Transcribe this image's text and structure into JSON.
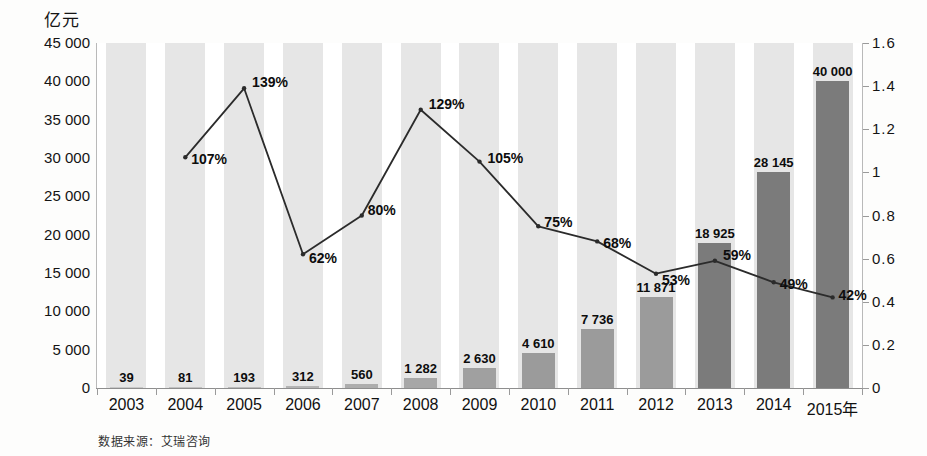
{
  "chart_data": {
    "type": "bar",
    "title": "",
    "subtitle": "",
    "xlabel": "",
    "ylabel": "亿元",
    "y2label": "",
    "ylim": [
      0,
      45000
    ],
    "y2lim": [
      0,
      1.6
    ],
    "grid": false,
    "legend_position": "none",
    "categories": [
      "2003",
      "2004",
      "2005",
      "2006",
      "2007",
      "2008",
      "2009",
      "2010",
      "2011",
      "2012",
      "2013",
      "2014",
      "2015年"
    ],
    "series": [
      {
        "name": "交易规模",
        "type": "bar",
        "axis": "left",
        "values": [
          39,
          81,
          193,
          312,
          560,
          1282,
          2630,
          4610,
          7736,
          11871,
          18925,
          28145,
          40000
        ],
        "value_labels": [
          "39",
          "81",
          "193",
          "312",
          "560",
          "1 282",
          "2 630",
          "4 610",
          "7 736",
          "11 871",
          "18 925",
          "28 145",
          "40 000"
        ]
      },
      {
        "name": "增长率",
        "type": "line",
        "axis": "right",
        "x": [
          "2004",
          "2005",
          "2006",
          "2007",
          "2008",
          "2009",
          "2010",
          "2011",
          "2012",
          "2013",
          "2014",
          "2015年"
        ],
        "values": [
          1.07,
          1.39,
          0.62,
          0.8,
          1.29,
          1.05,
          0.75,
          0.68,
          0.53,
          0.59,
          0.49,
          0.42
        ],
        "value_labels": [
          "107%",
          "139%",
          "62%",
          "80%",
          "129%",
          "105%",
          "75%",
          "68%",
          "53%",
          "59%",
          "49%",
          "42%"
        ]
      }
    ],
    "y_tick_labels": [
      "45 000",
      "40 000",
      "35 000",
      "30 000",
      "25 000",
      "20 000",
      "15 000",
      "10 000",
      "5 000",
      "0"
    ],
    "y_tick_values": [
      45000,
      40000,
      35000,
      30000,
      25000,
      20000,
      15000,
      10000,
      5000,
      0
    ],
    "y2_tick_labels": [
      "1.6",
      "1.4",
      "1.2",
      "1",
      "0.8",
      "0.6",
      "0.4",
      "0.2",
      "0"
    ],
    "y2_tick_values": [
      1.6,
      1.4,
      1.2,
      1.0,
      0.8,
      0.6,
      0.4,
      0.2,
      0.0
    ],
    "colors": {
      "bar_light": "#c9c9c9",
      "bar_mid": "#9b9b9b",
      "bar_dark": "#7b7b7b",
      "line": "#2b2b2b",
      "stripe": "#e2e2e2",
      "text": "#111111"
    }
  },
  "footer": {
    "source_text": "数据来源：艾瑞咨询"
  }
}
